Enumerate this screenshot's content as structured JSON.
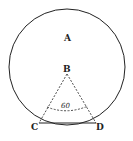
{
  "labels": {
    "A": "A",
    "B": "B",
    "C": "C",
    "D": "D"
  },
  "angle_label": "60",
  "colors": {
    "stroke": "#222222",
    "background": "#ffffff"
  }
}
